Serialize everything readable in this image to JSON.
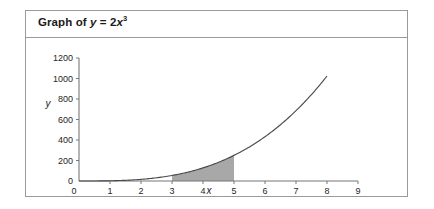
{
  "panel": {
    "title_prefix": "Graph of ",
    "title_y": "y",
    "title_equals": " = 2",
    "title_x": "x",
    "title_exponent": "3",
    "title_plain": "Graph of y = 2x^3",
    "border_color": "#9a9a9a"
  },
  "chart_data": {
    "type": "line",
    "equation": "y = 2x^3",
    "xlabel": "x",
    "ylabel": "y",
    "xlim": [
      0,
      9
    ],
    "ylim": [
      0,
      1200
    ],
    "grid": false,
    "legend": false,
    "x_ticks": [
      "0",
      "1",
      "2",
      "3",
      "4",
      "5",
      "6",
      "7",
      "8",
      "9"
    ],
    "x_tick_values": [
      0,
      1,
      2,
      3,
      4,
      5,
      6,
      7,
      8,
      9
    ],
    "y_ticks": [
      "0",
      "200",
      "400",
      "600",
      "800",
      "1000",
      "1200"
    ],
    "y_tick_values": [
      0,
      200,
      400,
      600,
      800,
      1000,
      1200
    ],
    "series": [
      {
        "name": "y = 2x^3",
        "color": "#4b4b4b",
        "x_start": 0,
        "x_end": 8,
        "x": [
          0,
          0.5,
          1,
          1.5,
          2,
          2.5,
          3,
          3.5,
          4,
          4.5,
          5,
          5.5,
          6,
          6.5,
          7,
          7.5,
          8
        ],
        "values": [
          0,
          0.25,
          2,
          6.75,
          16,
          31.25,
          54,
          85.75,
          128,
          182.25,
          250,
          332.75,
          432,
          549.25,
          686,
          843.75,
          1024
        ]
      }
    ],
    "shaded_region": {
      "label": "area under curve",
      "x_from": 3,
      "x_to": 5,
      "y_from": 0,
      "fill_color": "#a8a8a8",
      "bounded_above_by": "y = 2x^3"
    }
  }
}
